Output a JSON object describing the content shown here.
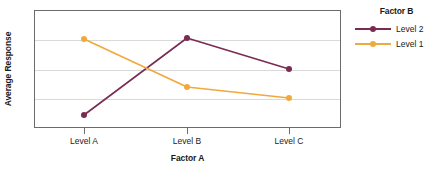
{
  "chart_data": {
    "type": "line",
    "title": "",
    "xlabel": "Factor A",
    "ylabel": "Average Response",
    "categories": [
      "Level A",
      "Level B",
      "Level C"
    ],
    "legend_title": "Factor B",
    "legend_position": "right",
    "grid": true,
    "gridlines": 3,
    "yaxis_ticklabels": [],
    "series": [
      {
        "name": "Level 2",
        "color": "#7b2a52",
        "values": [
          10.5,
          75.5,
          50.0
        ],
        "points_px": [
          115,
          38,
          69
        ]
      },
      {
        "name": "Level 1",
        "color": "#efa93c",
        "values": [
          75.0,
          34.5,
          25.0
        ],
        "points_px": [
          39,
          87,
          98
        ]
      }
    ],
    "ylim": [
      0,
      100
    ],
    "axis_color": "#6b6b6b",
    "grid_color": "#d9d9d9"
  },
  "legend": {
    "title": "Factor B",
    "entries": [
      {
        "label": "Level 2",
        "color": "#7b2a52"
      },
      {
        "label": "Level 1",
        "color": "#efa93c"
      }
    ]
  },
  "axes": {
    "x_title": "Factor A",
    "y_title": "Average Response",
    "x_labels": [
      "Level A",
      "Level B",
      "Level C"
    ]
  }
}
